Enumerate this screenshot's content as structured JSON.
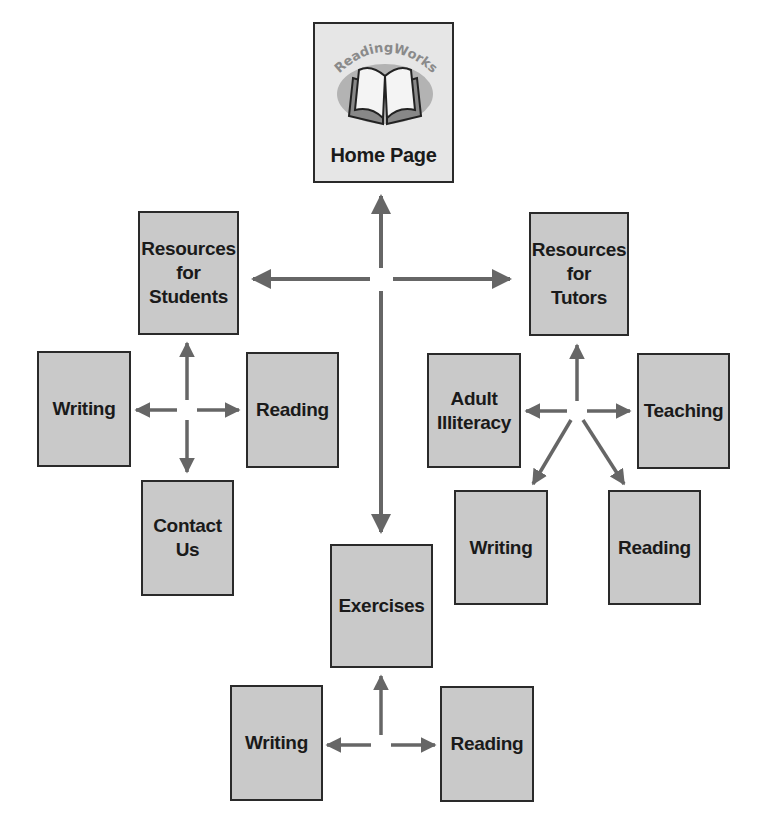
{
  "diagram": {
    "colors": {
      "box_fill": "#c9c9c9",
      "home_fill": "#e6e6e6",
      "border": "#2a2a2a",
      "arrow": "#666666",
      "text": "#1a1a1a"
    },
    "home": {
      "logo_text": "ReadingWorks",
      "label": "Home Page"
    },
    "nodes": {
      "resources_students": "Resources\nfor\nStudents",
      "resources_tutors": "Resources\nfor\nTutors",
      "students_writing": "Writing",
      "students_reading": "Reading",
      "contact_us": "Contact\nUs",
      "adult_illiteracy": "Adult\nIlliteracy",
      "teaching": "Teaching",
      "tutors_writing": "Writing",
      "tutors_reading": "Reading",
      "exercises": "Exercises",
      "exercises_writing": "Writing",
      "exercises_reading": "Reading"
    },
    "links": [
      {
        "from": "hub",
        "to": "Home Page"
      },
      {
        "from": "hub",
        "to": "Resources for Students"
      },
      {
        "from": "hub",
        "to": "Resources for Tutors"
      },
      {
        "from": "hub",
        "to": "Exercises"
      },
      {
        "from": "Resources for Students",
        "to": "Writing"
      },
      {
        "from": "Resources for Students",
        "to": "Reading"
      },
      {
        "from": "Resources for Students",
        "to": "Contact Us"
      },
      {
        "from": "Resources for Tutors",
        "to": "Adult Illiteracy"
      },
      {
        "from": "Resources for Tutors",
        "to": "Teaching"
      },
      {
        "from": "Resources for Tutors",
        "to": "Writing"
      },
      {
        "from": "Resources for Tutors",
        "to": "Reading"
      },
      {
        "from": "Exercises",
        "to": "Writing"
      },
      {
        "from": "Exercises",
        "to": "Reading"
      }
    ]
  }
}
